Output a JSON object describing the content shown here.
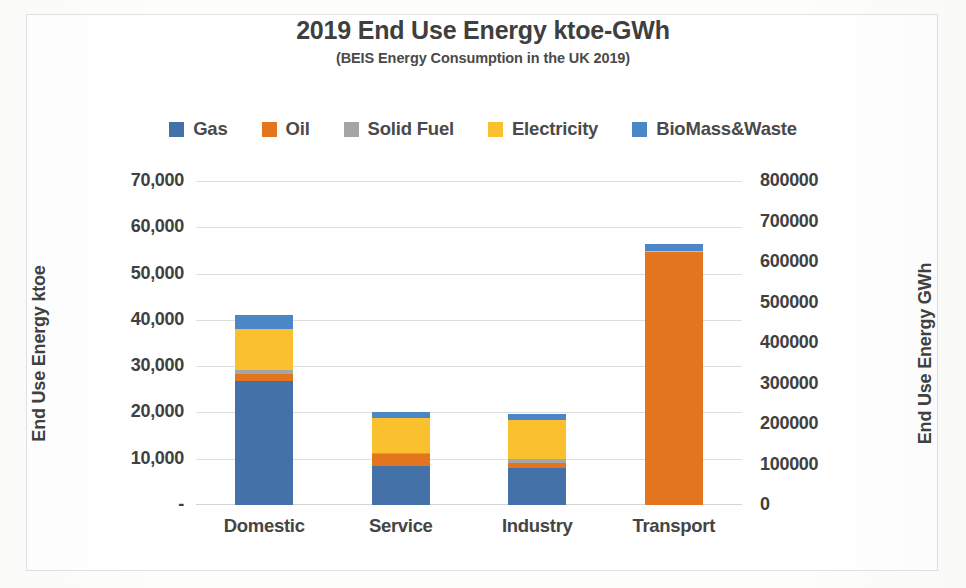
{
  "chart_data": {
    "type": "bar",
    "subtype": "stacked-column",
    "title": "2019 End Use Energy ktoe-GWh",
    "subtitle": "(BEIS Energy Consumption in the UK 2019)",
    "xlabel": "",
    "ylabel": "End Use Energy ktoe",
    "y2label": "End Use Energy GWh",
    "categories": [
      "Domestic",
      "Service",
      "Industry",
      "Transport"
    ],
    "series": [
      {
        "name": "Gas",
        "color": "#4472a8",
        "values": [
          26700,
          8400,
          8000,
          0
        ]
      },
      {
        "name": "Oil",
        "color": "#e2751e",
        "values": [
          1600,
          2700,
          1050,
          54700
        ]
      },
      {
        "name": "Solid Fuel",
        "color": "#a5a5a5",
        "values": [
          800,
          150,
          900,
          0
        ]
      },
      {
        "name": "Electricity",
        "color": "#fbc02d",
        "values": [
          9000,
          7500,
          8400,
          250
        ]
      },
      {
        "name": "BioMass&Waste",
        "color": "#4a86c8",
        "values": [
          2900,
          1350,
          1300,
          1550
        ]
      }
    ],
    "totals": [
      41000,
      20100,
      19650,
      56500
    ],
    "ylim": [
      0,
      70000
    ],
    "y2lim": [
      0,
      800000
    ],
    "yticks": [
      "-",
      "10,000",
      "20,000",
      "30,000",
      "40,000",
      "50,000",
      "60,000",
      "70,000"
    ],
    "ytick_values": [
      0,
      10000,
      20000,
      30000,
      40000,
      50000,
      60000,
      70000
    ],
    "y2ticks": [
      "0",
      "100000",
      "200000",
      "300000",
      "400000",
      "500000",
      "600000",
      "700000",
      "800000"
    ],
    "y2tick_values": [
      0,
      100000,
      200000,
      300000,
      400000,
      500000,
      600000,
      700000,
      800000
    ],
    "grid": "horizontal",
    "legend_position": "top",
    "legend": [
      "Gas",
      "Oil",
      "Solid Fuel",
      "Electricity",
      "BioMass&Waste"
    ],
    "colors": {
      "gas": "#4472a8",
      "oil": "#e2751e",
      "solid_fuel": "#a5a5a5",
      "electricity": "#fbc02d",
      "biomass_waste": "#4a86c8",
      "gridline": "#dededf",
      "text": "#404040",
      "frame": "#e2e2e2",
      "background": "#ffffff"
    }
  }
}
